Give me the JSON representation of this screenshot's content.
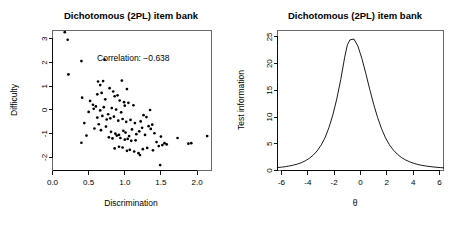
{
  "figure": {
    "width": 459,
    "height": 227,
    "background": "#ffffff",
    "foreground": "#000000",
    "panel_count": 2
  },
  "chart_data": [
    {
      "type": "scatter",
      "panel": "left",
      "title": "Dichotomous (2PL) item bank",
      "xlabel": "Discrimination",
      "ylabel": "Difficulty",
      "xlim": [
        0.0,
        2.2
      ],
      "ylim": [
        -2.55,
        3.35
      ],
      "xticks": [
        0.0,
        0.5,
        1.0,
        1.5,
        2.0
      ],
      "xticklabels": [
        "0.0",
        "0.5",
        "1.0",
        "1.5",
        "2.0"
      ],
      "yticks": [
        -2,
        -1,
        0,
        1,
        2,
        3
      ],
      "yticklabels": [
        "-2",
        "-1",
        "0",
        "1",
        "2",
        "3"
      ],
      "grid": false,
      "legend": null,
      "annotation": {
        "text": "Correlation: −0.638",
        "x": 1.62,
        "y": 2.05,
        "correlation_value": -0.638
      },
      "marker": {
        "shape": "circle",
        "size": 1.35,
        "color": "#000000"
      },
      "n_points": 100,
      "x": [
        0.17,
        0.21,
        0.4,
        0.22,
        0.72,
        0.41,
        0.52,
        0.63,
        0.66,
        0.7,
        0.79,
        0.84,
        0.96,
        0.62,
        0.68,
        0.56,
        0.6,
        0.73,
        0.86,
        0.9,
        0.93,
        0.99,
        1.03,
        0.5,
        0.57,
        0.66,
        0.71,
        0.77,
        0.82,
        0.88,
        0.95,
        1.0,
        1.05,
        1.12,
        1.26,
        1.35,
        0.47,
        0.62,
        0.69,
        0.75,
        0.8,
        0.85,
        0.91,
        0.97,
        1.02,
        1.08,
        1.14,
        1.22,
        1.3,
        1.38,
        0.4,
        0.58,
        0.67,
        0.74,
        0.81,
        0.87,
        0.92,
        0.98,
        1.01,
        1.06,
        1.1,
        1.16,
        1.24,
        1.33,
        1.41,
        1.5,
        0.44,
        0.64,
        0.78,
        0.83,
        0.89,
        0.94,
        1.0,
        1.04,
        1.09,
        1.15,
        1.2,
        1.28,
        1.36,
        1.44,
        1.55,
        1.73,
        0.86,
        0.92,
        0.97,
        1.03,
        1.07,
        1.13,
        1.19,
        1.25,
        1.31,
        1.39,
        1.47,
        1.52,
        1.58,
        1.88,
        1.92,
        2.14,
        1.49,
        1.21
      ],
      "y": [
        3.28,
        2.96,
        2.06,
        1.5,
        2.12,
        0.52,
        0.38,
        1.2,
        1.05,
        1.22,
        0.92,
        0.78,
        1.24,
        0.66,
        0.72,
        0.22,
        0.15,
        0.45,
        0.58,
        0.62,
        0.4,
        0.33,
        0.88,
        -0.08,
        0.05,
        -0.02,
        0.12,
        -0.18,
        0.08,
        0.02,
        -0.1,
        0.18,
        0.3,
        0.2,
        -0.22,
        0.0,
        -1.08,
        -0.32,
        -0.25,
        -0.4,
        -0.35,
        -0.28,
        -0.45,
        -0.38,
        -0.5,
        -0.42,
        -0.55,
        -0.48,
        -0.3,
        -0.62,
        -1.38,
        -0.78,
        -0.85,
        -0.7,
        -0.92,
        -1.0,
        -1.05,
        -0.88,
        -0.95,
        -1.1,
        -0.82,
        -1.02,
        -0.75,
        -0.68,
        -0.98,
        -1.12,
        -0.55,
        -0.6,
        -1.15,
        -1.2,
        -1.08,
        -1.18,
        -1.25,
        -1.22,
        -1.3,
        -1.28,
        -0.9,
        -1.05,
        -0.8,
        -1.35,
        -1.4,
        -1.18,
        -1.62,
        -1.55,
        -1.58,
        -1.72,
        -1.68,
        -1.75,
        -1.82,
        -1.65,
        -1.6,
        -1.7,
        -1.52,
        -1.48,
        -1.45,
        -1.42,
        -1.4,
        -1.1,
        -2.32,
        -1.9
      ]
    },
    {
      "type": "line",
      "panel": "right",
      "title": "Dichotomous (2PL) item bank",
      "xlabel": "θ",
      "ylabel": "Test information",
      "xlim": [
        -6.3,
        6.3
      ],
      "ylim": [
        0,
        26.2
      ],
      "xticks": [
        -6,
        -4,
        -2,
        0,
        2,
        4,
        6
      ],
      "xticklabels": [
        "-6",
        "-4",
        "-2",
        "0",
        "2",
        "4",
        "6"
      ],
      "yticks": [
        0,
        5,
        10,
        15,
        20,
        25
      ],
      "yticklabels": [
        "0",
        "5",
        "10",
        "15",
        "20",
        "25"
      ],
      "grid": false,
      "legend": null,
      "peak": {
        "theta": -1.0,
        "information": 24.6
      },
      "series": [
        {
          "name": "Test information",
          "color": "#000000",
          "x": [
            -6.3,
            -6.0,
            -5.7,
            -5.4,
            -5.1,
            -4.8,
            -4.5,
            -4.2,
            -3.9,
            -3.6,
            -3.3,
            -3.0,
            -2.7,
            -2.4,
            -2.1,
            -1.8,
            -1.5,
            -1.2,
            -1.0,
            -0.8,
            -0.5,
            -0.2,
            0.1,
            0.4,
            0.7,
            1.0,
            1.3,
            1.6,
            1.9,
            2.2,
            2.5,
            2.8,
            3.1,
            3.4,
            3.7,
            4.0,
            4.3,
            4.6,
            4.9,
            5.2,
            5.5,
            5.8,
            6.1,
            6.3
          ],
          "y": [
            0.55,
            0.62,
            0.72,
            0.85,
            1.0,
            1.2,
            1.45,
            1.8,
            2.25,
            2.85,
            3.65,
            4.7,
            6.1,
            8.0,
            10.4,
            13.4,
            17.0,
            21.2,
            23.5,
            24.45,
            24.6,
            23.3,
            21.0,
            18.2,
            15.2,
            12.4,
            9.9,
            7.8,
            6.1,
            4.8,
            3.8,
            3.05,
            2.45,
            2.0,
            1.65,
            1.38,
            1.16,
            0.99,
            0.86,
            0.76,
            0.67,
            0.6,
            0.54,
            0.5
          ]
        }
      ]
    }
  ]
}
